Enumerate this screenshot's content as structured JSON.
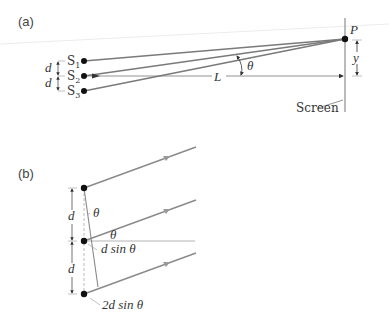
{
  "figure": {
    "panel_a": {
      "label": "(a)",
      "sources": [
        {
          "name": "S",
          "sub": "1"
        },
        {
          "name": "S",
          "sub": "2"
        },
        {
          "name": "S",
          "sub": "3"
        }
      ],
      "spacing_labels": [
        "d",
        "d"
      ],
      "distance_label": "L",
      "angle_label": "θ",
      "point_label": "P",
      "height_label": "y",
      "screen_label": "Screen"
    },
    "panel_b": {
      "label": "(b)",
      "spacing_labels": [
        "d",
        "d"
      ],
      "angle_labels": [
        "θ",
        "θ"
      ],
      "path_diff_1": "d sin θ",
      "path_diff_2": "2d sin θ"
    },
    "colors": {
      "ray": "#8a8a8a",
      "dot": "#111111",
      "text": "#333333",
      "faint": "#e6e6e6"
    }
  }
}
